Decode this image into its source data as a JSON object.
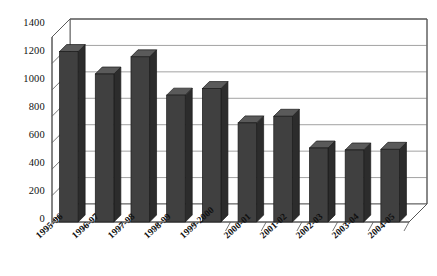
{
  "chart_data": {
    "type": "bar",
    "title": "",
    "subtitle": "",
    "xlabel": "",
    "ylabel": "",
    "categories": [
      "1995-96",
      "1996-97",
      "1997-98",
      "1998-99",
      "1999-2000",
      "2000-01",
      "2001-02",
      "2002-03",
      "2003-04",
      "2004-05"
    ],
    "values": [
      1290,
      1120,
      1250,
      960,
      1010,
      750,
      800,
      560,
      545,
      550
    ],
    "series": [
      {
        "name": "Series 1",
        "values": [
          1290,
          1120,
          1250,
          960,
          1010,
          750,
          800,
          560,
          545,
          550
        ]
      }
    ],
    "ylim": [
      0,
      1400
    ],
    "ytick_step": 200,
    "ytick_labels": [
      "1400",
      "1200",
      "1000",
      "800",
      "600",
      "400",
      "200",
      "0"
    ],
    "ytick_values": [
      1400,
      1200,
      1000,
      800,
      600,
      400,
      200,
      0
    ],
    "grid": true,
    "grid_axis": "y",
    "legend": false,
    "legend_position": "none",
    "three_d": true,
    "bar_color": "#404040",
    "bar_side_color": "#2c2c2c",
    "bar_top_color": "#5a5a5a",
    "grid_color": "#8a8a8a",
    "axis_color": "#555555",
    "background": "#ffffff",
    "annotations": []
  }
}
